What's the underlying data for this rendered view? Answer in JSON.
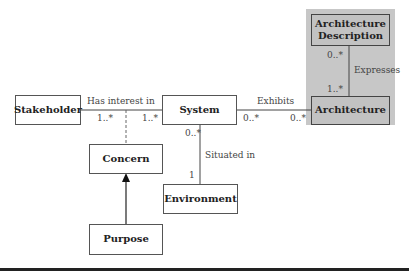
{
  "diagram": {
    "classes": {
      "stakeholder": "Stakeholder",
      "system": "System",
      "architecture": "Architecture",
      "architecture_description": "Architecture Description",
      "concern": "Concern",
      "environment": "Environment",
      "purpose": "Purpose"
    },
    "associations": {
      "has_interest_in": {
        "label": "Has interest in",
        "mult_stakeholder": "1..*",
        "mult_system": "1..*"
      },
      "exhibits": {
        "label": "Exhibits",
        "mult_system": "0..*",
        "mult_architecture": "0..*"
      },
      "expresses": {
        "label": "Expresses",
        "mult_description": "0..*",
        "mult_architecture": "1..*"
      },
      "situated_in": {
        "label": "Situated in",
        "mult_system": "0..*",
        "mult_environment": "1"
      }
    },
    "colors": {
      "highlight_panel": "#c7c7c7",
      "line": "#444444"
    }
  }
}
